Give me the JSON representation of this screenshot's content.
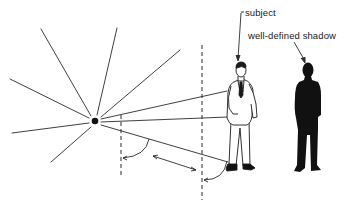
{
  "diagram": {
    "type": "illustration",
    "labels": {
      "subject": "subject",
      "shadow": "well-defined shadow"
    },
    "colors": {
      "line": "#2a2a2a",
      "shadow_fill": "#111111",
      "background": "#ffffff"
    },
    "elements": [
      {
        "id": "light-source",
        "kind": "point",
        "x": 95,
        "y": 121
      },
      {
        "id": "subject-figure",
        "kind": "figure-outline"
      },
      {
        "id": "shadow-figure",
        "kind": "figure-silhouette"
      },
      {
        "id": "dashed-line-near",
        "kind": "dashed-vertical",
        "x": 121
      },
      {
        "id": "dashed-line-far",
        "kind": "dashed-vertical",
        "x": 202
      },
      {
        "id": "distance-arrow",
        "kind": "double-arrow"
      }
    ]
  }
}
